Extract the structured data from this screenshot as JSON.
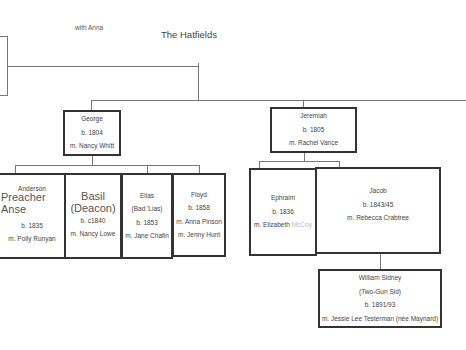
{
  "diagram": {
    "title": "The Hatfields",
    "note": "with Anna",
    "generation1": [
      {
        "name": "George",
        "born": "b. 1804",
        "married": "m. Nancy Whitt"
      },
      {
        "name": "Jeremiah",
        "born": "b. 1805",
        "married": "m. Rachel Vance"
      }
    ],
    "george_children": [
      {
        "name": "Anderson",
        "nickname": "Preacher Anse",
        "born": "b. 1835",
        "married": "m. Polly Runyan"
      },
      {
        "name": "Basil",
        "nickname": "(Deacon)",
        "born": "b. c1840",
        "married": "m. Nancy Lowe"
      },
      {
        "name": "Elias",
        "nickname": "(Bad 'Lias)",
        "born": "b. 1853",
        "married": "m. Jane Chafin"
      },
      {
        "name": "Floyd",
        "born": "b. 1858",
        "married": "m. Anna Pinson",
        "married2": "m. Jenny Hunt"
      }
    ],
    "jeremiah_children": [
      {
        "name": "Ephraim",
        "born": "b. 1836",
        "married_prefix": "m. Elizabeth",
        "married_faded": "McCoy"
      },
      {
        "name": "Jacob",
        "born": "b. 1843/45",
        "married": "m. Rebecca Crabtree"
      }
    ],
    "jacob_children": [
      {
        "name": "William Sidney",
        "nickname": "(Two-Gun Sid)",
        "born": "b. 1891/93",
        "married": "m. Jessie Lee Testerman (née Maynard)"
      }
    ]
  }
}
